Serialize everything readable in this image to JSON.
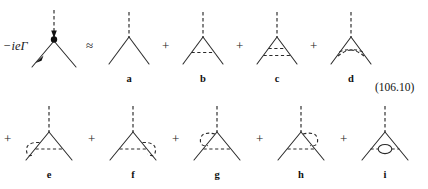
{
  "page": {
    "equation_number": "(106.10)",
    "cropped_top_text": "",
    "operators": {
      "approx": "≈",
      "plus": "+"
    },
    "vertex_label": "−ieΓ"
  },
  "rows": [
    {
      "row_id": "row-1",
      "items": [
        {
          "kind": "label",
          "name": "vertex-function-label",
          "text": "−ieΓ"
        },
        {
          "kind": "diagram",
          "name": "diagram-full-vertex",
          "label": "",
          "variant": "blob-vertex"
        },
        {
          "kind": "operator",
          "name": "approx-operator",
          "text": "≈"
        },
        {
          "kind": "diagram",
          "name": "diagram-a",
          "label": "a",
          "variant": "bare-vertex"
        },
        {
          "kind": "operator",
          "name": "plus-operator",
          "text": "+"
        },
        {
          "kind": "diagram",
          "name": "diagram-b",
          "label": "b",
          "variant": "one-rung"
        },
        {
          "kind": "operator",
          "name": "plus-operator",
          "text": "+"
        },
        {
          "kind": "diagram",
          "name": "diagram-c",
          "label": "c",
          "variant": "two-rungs"
        },
        {
          "kind": "operator",
          "name": "plus-operator",
          "text": "+"
        },
        {
          "kind": "diagram",
          "name": "diagram-d",
          "label": "d",
          "variant": "crossed-rungs"
        }
      ]
    },
    {
      "row_id": "row-2",
      "items": [
        {
          "kind": "operator",
          "name": "plus-operator",
          "text": "+"
        },
        {
          "kind": "diagram",
          "name": "diagram-e",
          "label": "e",
          "variant": "rung-loop-left-leg"
        },
        {
          "kind": "operator",
          "name": "plus-operator",
          "text": "+"
        },
        {
          "kind": "diagram",
          "name": "diagram-f",
          "label": "f",
          "variant": "rung-loop-right-leg"
        },
        {
          "kind": "operator",
          "name": "plus-operator",
          "text": "+"
        },
        {
          "kind": "diagram",
          "name": "diagram-g",
          "label": "g",
          "variant": "rung-loop-upper-left"
        },
        {
          "kind": "operator",
          "name": "plus-operator",
          "text": "+"
        },
        {
          "kind": "diagram",
          "name": "diagram-h",
          "label": "h",
          "variant": "rung-loop-upper-right"
        },
        {
          "kind": "operator",
          "name": "plus-operator",
          "text": "+"
        },
        {
          "kind": "diagram",
          "name": "diagram-i",
          "label": "i",
          "variant": "rung-bubble"
        }
      ]
    }
  ],
  "labels": {
    "a": "a",
    "b": "b",
    "c": "c",
    "d": "d",
    "e": "e",
    "f": "f",
    "g": "g",
    "h": "h",
    "i": "i"
  }
}
